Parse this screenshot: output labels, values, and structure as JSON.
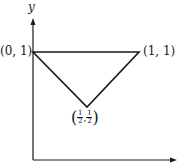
{
  "diagram": {
    "axis_label_y": "y",
    "vertices": [
      {
        "label": "(0, 1)",
        "x": 0,
        "y": 1
      },
      {
        "label": "(1, 1)",
        "x": 1,
        "y": 1
      },
      {
        "label_num": "1",
        "label_den": "2",
        "x": 0.5,
        "y": 0.5
      }
    ],
    "colors": {
      "line": "#1a1a1a",
      "background": "#ffffff"
    }
  }
}
